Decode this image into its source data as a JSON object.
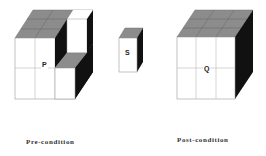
{
  "diagram": {
    "pre_condition": {
      "caption": "Pre-condition",
      "cube_label": "P"
    },
    "operand": {
      "block_label": "S"
    },
    "post_condition": {
      "caption": "Post-condition",
      "cube_label": "Q"
    },
    "colors": {
      "front_face": "#ffffff",
      "top_face": "#8c8c8c",
      "side_face": "#111111",
      "grid_line": "#bbbbbb",
      "outline": "#666666"
    }
  }
}
